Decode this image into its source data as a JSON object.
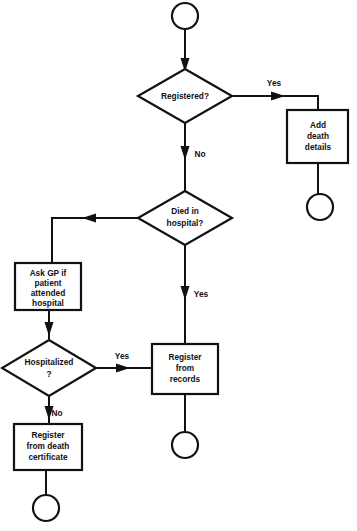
{
  "diagram": {
    "type": "flowchart",
    "background_color": "#ffffff",
    "line_color": "#111111",
    "text_color": "#111111",
    "nodes": [
      {
        "id": "start",
        "shape": "terminator-circle",
        "label": "",
        "cx": 185,
        "cy": 16,
        "r": 13
      },
      {
        "id": "registered",
        "shape": "decision-diamond",
        "label": "Registered?",
        "lines": [
          "Registered?"
        ],
        "cx": 185,
        "cy": 96,
        "rx": 47,
        "ry": 27
      },
      {
        "id": "add-death-details",
        "shape": "process-box",
        "label": "Add death details",
        "lines": [
          "Add",
          "death",
          "details"
        ],
        "x": 287,
        "y": 110,
        "w": 61,
        "h": 53
      },
      {
        "id": "end-added",
        "shape": "terminator-circle",
        "label": "",
        "cx": 320,
        "cy": 207,
        "r": 13
      },
      {
        "id": "died-in-hospital",
        "shape": "decision-diamond",
        "label": "Died in hospital?",
        "lines": [
          "Died in",
          "hospital?"
        ],
        "cx": 185,
        "cy": 218,
        "rx": 47,
        "ry": 27
      },
      {
        "id": "ask-gp",
        "shape": "process-box",
        "label": "Ask GP if patient attended hospital",
        "lines": [
          "Ask GP if",
          "patient",
          "attended",
          "hospital"
        ],
        "x": 15,
        "y": 263,
        "w": 66,
        "h": 47
      },
      {
        "id": "hospitalized",
        "shape": "decision-diamond",
        "label": "Hospitalized ?",
        "lines": [
          "Hospitalized",
          "?"
        ],
        "cx": 49,
        "cy": 368,
        "rx": 47,
        "ry": 28
      },
      {
        "id": "register-from-records",
        "shape": "process-box",
        "label": "Register from records",
        "lines": [
          "Register",
          "from",
          "records"
        ],
        "x": 152,
        "y": 344,
        "w": 66,
        "h": 50
      },
      {
        "id": "end-records",
        "shape": "terminator-circle",
        "label": "",
        "cx": 185,
        "cy": 445,
        "r": 13
      },
      {
        "id": "register-from-death-certificate",
        "shape": "process-box",
        "label": "Register from death certificate",
        "lines": [
          "Register",
          "from death",
          "certificate"
        ],
        "x": 14,
        "y": 424,
        "w": 68,
        "h": 46
      },
      {
        "id": "end-certificate",
        "shape": "terminator-circle",
        "label": "",
        "cx": 46,
        "cy": 508,
        "r": 13
      }
    ],
    "edges": [
      {
        "id": "start-to-registered",
        "from": "start",
        "to": "registered",
        "label": ""
      },
      {
        "id": "registered-yes-to-add-death-details",
        "from": "registered",
        "to": "add-death-details",
        "label": "Yes",
        "label_x": 274,
        "label_y": 84
      },
      {
        "id": "add-death-details-to-end",
        "from": "add-death-details",
        "to": "end-added",
        "label": ""
      },
      {
        "id": "registered-no-to-died-in-hospital",
        "from": "registered",
        "to": "died-in-hospital",
        "label": "No",
        "label_x": 200,
        "label_y": 155
      },
      {
        "id": "died-in-hospital-no-to-ask-gp",
        "from": "died-in-hospital",
        "to": "ask-gp",
        "label": ""
      },
      {
        "id": "died-in-hospital-yes-to-register-from-records",
        "from": "died-in-hospital",
        "to": "register-from-records",
        "label": "Yes",
        "label_x": 201,
        "label_y": 295
      },
      {
        "id": "ask-gp-to-hospitalized",
        "from": "ask-gp",
        "to": "hospitalized",
        "label": ""
      },
      {
        "id": "hospitalized-yes-to-register-from-records",
        "from": "hospitalized",
        "to": "register-from-records",
        "label": "Yes",
        "label_x": 122,
        "label_y": 357
      },
      {
        "id": "hospitalized-no-to-register-from-death-certificate",
        "from": "hospitalized",
        "to": "register-from-death-certificate",
        "label": "No",
        "label_x": 57,
        "label_y": 414
      },
      {
        "id": "register-from-records-to-end",
        "from": "register-from-records",
        "to": "end-records",
        "label": ""
      },
      {
        "id": "register-from-death-certificate-to-end",
        "from": "register-from-death-certificate",
        "to": "end-certificate",
        "label": ""
      }
    ]
  }
}
